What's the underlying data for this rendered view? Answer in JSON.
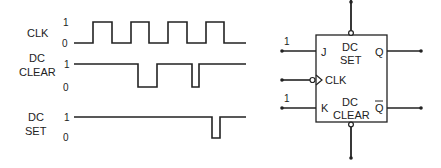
{
  "timing": {
    "signals": [
      {
        "name_lines": [
          "CLK"
        ],
        "high_label": "1",
        "low_label": "0"
      },
      {
        "name_lines": [
          "DC",
          "CLEAR"
        ],
        "high_label": "1",
        "low_label": "0"
      },
      {
        "name_lines": [
          "DC",
          "SET"
        ],
        "high_label": "1",
        "low_label": "0"
      }
    ]
  },
  "flipflop": {
    "j_label": "J",
    "k_label": "K",
    "clk_label": "CLK",
    "q_label": "Q",
    "qbar_label": "Q",
    "set_lines": [
      "DC",
      "SET"
    ],
    "clear_lines": [
      "DC",
      "CLEAR"
    ],
    "j_input_value": "1",
    "k_input_value": "1"
  },
  "colors": {
    "ink": "#222222",
    "background": "#ffffff"
  }
}
